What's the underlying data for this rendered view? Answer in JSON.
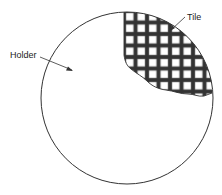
{
  "diagram": {
    "labels": {
      "holder": "Holder",
      "tile": "Tile"
    },
    "colors": {
      "stroke": "#333333",
      "background": "#ffffff"
    },
    "holder": {
      "shape": "circle",
      "cx": 127,
      "cy": 98,
      "r": 86
    },
    "tile": {
      "pattern": "square grid",
      "cell_pitch_px": 11.5
    }
  }
}
